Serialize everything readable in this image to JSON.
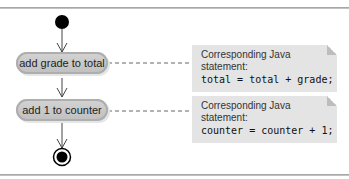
{
  "diagram": {
    "type": "UML activity diagram",
    "actions": [
      {
        "label": "add grade to total"
      },
      {
        "label": "add 1 to counter"
      }
    ],
    "notes": [
      {
        "caption": "Corresponding Java statement:",
        "code": "total = total + grade;"
      },
      {
        "caption": "Corresponding Java statement:",
        "code": "counter = counter + 1;"
      }
    ],
    "nodes": {
      "initial": "initial-state",
      "final": "final-state"
    },
    "colors": {
      "action_fill": "#c8c8c8",
      "note_fill": "#e4e4e4",
      "line": "#555555",
      "node": "#000000"
    }
  }
}
